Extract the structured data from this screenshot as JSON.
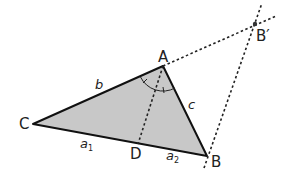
{
  "figure": {
    "type": "angle-bisector-theorem-construction",
    "colors": {
      "triangle_fill": "#c8c8c8",
      "triangle_stroke": "#111111",
      "dashed_stroke": "#222222",
      "label": "#222222"
    },
    "vertices": {
      "A": {
        "label": "A",
        "x": 163,
        "y": 66
      },
      "B": {
        "label": "B",
        "x": 207,
        "y": 156
      },
      "C": {
        "label": "C",
        "x": 33,
        "y": 124
      },
      "D": {
        "label": "D",
        "x": 138,
        "y": 143
      },
      "B_prime": {
        "label": "B′",
        "x": 255,
        "y": 24
      }
    },
    "side_labels": {
      "b": "b",
      "c": "c",
      "a1_base": "a",
      "a1_sub": "1",
      "a2_base": "a",
      "a2_sub": "2"
    },
    "dashed_lines": [
      {
        "name": "bisector-AD",
        "from": "A",
        "to": "D"
      },
      {
        "name": "extension-CA-to-Bprime",
        "from": "A",
        "to": "B_prime"
      },
      {
        "name": "parallel-through-B",
        "from": "B",
        "to": "B_prime"
      }
    ],
    "angle_marks": {
      "vertex": "A",
      "arcs": 1,
      "ticks": 2
    }
  }
}
